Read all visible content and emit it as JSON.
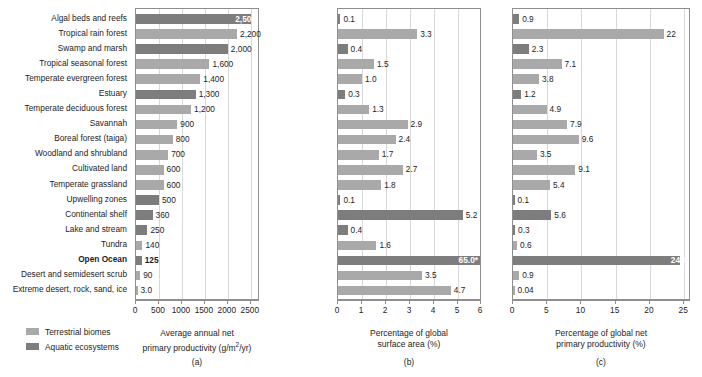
{
  "legend": {
    "items": [
      {
        "label": "Terrestrial biomes",
        "color": "#a9a9a9",
        "key": "terr"
      },
      {
        "label": "Aquatic ecosystems",
        "color": "#7d7d7d",
        "key": "aqua"
      }
    ]
  },
  "categories": [
    "Algal beds and reefs",
    "Tropical rain forest",
    "Swamp and marsh",
    "Tropical seasonal forest",
    "Temperate evergreen forest",
    "Estuary",
    "Temperate deciduous forest",
    "Savannah",
    "Boreal forest (taiga)",
    "Woodland and shrubland",
    "Cultivated land",
    "Temperate grassland",
    "Upwelling zones",
    "Continental shelf",
    "Lake and stream",
    "Tundra",
    "Open Ocean",
    "Desert and semidesert scrub",
    "Extreme desert, rock, sand, ice"
  ],
  "category_types": [
    "aqua",
    "terr",
    "aqua",
    "terr",
    "terr",
    "aqua",
    "terr",
    "terr",
    "terr",
    "terr",
    "terr",
    "terr",
    "aqua",
    "aqua",
    "aqua",
    "terr",
    "aqua",
    "terr",
    "terr"
  ],
  "category_bold": [
    false,
    false,
    false,
    false,
    false,
    false,
    false,
    false,
    false,
    false,
    false,
    false,
    false,
    false,
    false,
    false,
    true,
    false,
    false
  ],
  "chart_data": [
    {
      "type": "bar",
      "orientation": "horizontal",
      "panel": "(a)",
      "title": "",
      "xlabel": "Average annual net primary productivity (g/m2/yr)",
      "xlabel_line1": "Average annual net",
      "xlabel_line2_pre": "primary productivity (g/m",
      "xlabel_line2_sup": "2",
      "xlabel_line2_post": "/yr)",
      "ylabel": "",
      "xlim": [
        0,
        2700
      ],
      "ticks": [
        0,
        500,
        1000,
        1500,
        2000,
        2500
      ],
      "tick_labels": [
        "0",
        "500",
        "1000",
        "1500",
        "2000",
        "2500"
      ],
      "grid": true,
      "categories": [
        "Algal beds and reefs",
        "Tropical rain forest",
        "Swamp and marsh",
        "Tropical seasonal forest",
        "Temperate evergreen forest",
        "Estuary",
        "Temperate deciduous forest",
        "Savannah",
        "Boreal forest (taiga)",
        "Woodland and shrubland",
        "Cultivated land",
        "Temperate grassland",
        "Upwelling zones",
        "Continental shelf",
        "Lake and stream",
        "Tundra",
        "Open Ocean",
        "Desert and semidesert scrub",
        "Extreme desert, rock, sand, ice"
      ],
      "values": [
        2500,
        2200,
        2000,
        1600,
        1400,
        1300,
        1200,
        900,
        800,
        700,
        600,
        600,
        500,
        360,
        250,
        140,
        125,
        90,
        3.0
      ],
      "data_labels": [
        "2,500",
        "2,200",
        "2,000",
        "1,600",
        "1,400",
        "1,300",
        "1,200",
        "900",
        "800",
        "700",
        "600",
        "600",
        "500",
        "360",
        "250",
        "140",
        "125",
        "90",
        "3.0"
      ],
      "label_inside": [
        true,
        false,
        false,
        false,
        false,
        false,
        false,
        false,
        false,
        false,
        false,
        false,
        false,
        false,
        false,
        false,
        false,
        false,
        false
      ],
      "label_bold": [
        false,
        false,
        false,
        false,
        false,
        false,
        false,
        false,
        false,
        false,
        false,
        false,
        false,
        false,
        false,
        false,
        true,
        false,
        false
      ]
    },
    {
      "type": "bar",
      "orientation": "horizontal",
      "panel": "(b)",
      "title": "",
      "xlabel": "Percentage of global surface area (%)",
      "xlabel_line1": "Percentage of global",
      "xlabel_line2_pre": "surface area (%)",
      "xlabel_line2_sup": "",
      "xlabel_line2_post": "",
      "ylabel": "",
      "xlim": [
        0,
        6
      ],
      "ticks": [
        0,
        1,
        2,
        3,
        4,
        5,
        6
      ],
      "tick_labels": [
        "0",
        "1",
        "2",
        "3",
        "4",
        "5",
        "6"
      ],
      "grid": true,
      "categories": [
        "Algal beds and reefs",
        "Tropical rain forest",
        "Swamp and marsh",
        "Tropical seasonal forest",
        "Temperate evergreen forest",
        "Estuary",
        "Temperate deciduous forest",
        "Savannah",
        "Boreal forest (taiga)",
        "Woodland and shrubland",
        "Cultivated land",
        "Temperate grassland",
        "Upwelling zones",
        "Continental shelf",
        "Lake and stream",
        "Tundra",
        "Open Ocean",
        "Desert and semidesert scrub",
        "Extreme desert, rock, sand, ice"
      ],
      "values": [
        0.1,
        3.3,
        0.4,
        1.5,
        1.0,
        0.3,
        1.3,
        2.9,
        2.4,
        1.7,
        2.7,
        1.8,
        0.1,
        5.2,
        0.4,
        1.6,
        65.0,
        3.5,
        4.7
      ],
      "data_labels": [
        "0.1",
        "3.3",
        "0.4",
        "1.5",
        "1.0",
        "0.3",
        "1.3",
        "2.9",
        "2.4",
        "1.7",
        "2.7",
        "1.8",
        "0.1",
        "5.2",
        "0.4",
        "1.6",
        "65.0*",
        "3.5",
        "4.7"
      ],
      "label_inside": [
        false,
        false,
        false,
        false,
        false,
        false,
        false,
        false,
        false,
        false,
        false,
        false,
        false,
        false,
        false,
        false,
        true,
        false,
        false
      ],
      "label_bold": [
        false,
        false,
        false,
        false,
        false,
        false,
        false,
        false,
        false,
        false,
        false,
        false,
        false,
        false,
        false,
        false,
        true,
        false,
        false
      ],
      "overflow_rows": [
        16
      ]
    },
    {
      "type": "bar",
      "orientation": "horizontal",
      "panel": "(c)",
      "title": "",
      "xlabel": "Percentage of global net primary productivity (%)",
      "xlabel_line1": "Percentage of global net",
      "xlabel_line2_pre": "primary productivity (%)",
      "xlabel_line2_sup": "",
      "xlabel_line2_post": "",
      "ylabel": "",
      "xlim": [
        0,
        26
      ],
      "ticks": [
        0,
        5,
        10,
        15,
        20,
        25
      ],
      "tick_labels": [
        "0",
        "5",
        "10",
        "15",
        "20",
        "25"
      ],
      "grid": true,
      "categories": [
        "Algal beds and reefs",
        "Tropical rain forest",
        "Swamp and marsh",
        "Tropical seasonal forest",
        "Temperate evergreen forest",
        "Estuary",
        "Temperate deciduous forest",
        "Savannah",
        "Boreal forest (taiga)",
        "Woodland and shrubland",
        "Cultivated land",
        "Temperate grassland",
        "Upwelling zones",
        "Continental shelf",
        "Lake and stream",
        "Tundra",
        "Open Ocean",
        "Desert and semidesert scrub",
        "Extreme desert, rock, sand, ice"
      ],
      "values": [
        0.9,
        22,
        2.3,
        7.1,
        3.8,
        1.2,
        4.9,
        7.9,
        9.6,
        3.5,
        9.1,
        5.4,
        0.1,
        5.6,
        0.3,
        0.6,
        24.4,
        0.9,
        0.04
      ],
      "data_labels": [
        "0.9",
        "22",
        "2.3",
        "7.1",
        "3.8",
        "1.2",
        "4.9",
        "7.9",
        "9.6",
        "3.5",
        "9.1",
        "5.4",
        "0.1",
        "5.6",
        "0.3",
        "0.6",
        "24.4",
        "0.9",
        "0.04"
      ],
      "label_inside": [
        false,
        false,
        false,
        false,
        false,
        false,
        false,
        false,
        false,
        false,
        false,
        false,
        false,
        false,
        false,
        false,
        true,
        false,
        false
      ],
      "label_bold": [
        false,
        false,
        false,
        false,
        false,
        false,
        false,
        false,
        false,
        false,
        false,
        false,
        false,
        false,
        false,
        false,
        true,
        false,
        false
      ]
    }
  ]
}
